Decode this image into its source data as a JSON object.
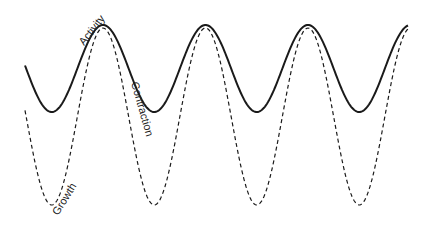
{
  "diagram": {
    "type": "wave-comparison",
    "colors": {
      "line": "#1a1a1a",
      "background": "#ffffff"
    },
    "period_px": 102.5,
    "curves": [
      {
        "name": "Activity",
        "style": "solid",
        "peaks_x": [
          103,
          205,
          308
        ],
        "troughs_x": [
          52,
          153,
          257,
          358
        ],
        "peak_y": 25,
        "trough_y": 112
      },
      {
        "name": "Growth",
        "style": "dashed",
        "peaks_x": [
          103,
          205,
          308
        ],
        "troughs_x": [
          52,
          153,
          257,
          358
        ],
        "peak_y": 28,
        "trough_y": 205
      }
    ],
    "labels": {
      "activity": "Activity",
      "contraction": "Contraction",
      "growth": "Growth"
    }
  }
}
